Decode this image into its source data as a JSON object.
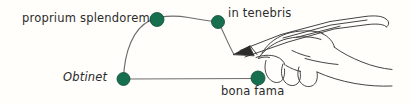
{
  "canvas": {
    "width": 412,
    "height": 104,
    "background": "#fffefb"
  },
  "palette": {
    "node_fill": "#16704f",
    "node_stroke": "#0d4a34",
    "edge_stroke": "#6d6d6d",
    "ink_stroke": "#3a3a3a",
    "text_color": "#2b2b2b"
  },
  "diagram": {
    "title": "",
    "nodes": [
      {
        "id": "obtinet",
        "label": "Obtinet",
        "x": 123,
        "y": 79,
        "r": 6.5,
        "label_position": "left"
      },
      {
        "id": "proprium-splendorem",
        "label": "proprium splendorem",
        "x": 157,
        "y": 19,
        "r": 7,
        "label_position": "left"
      },
      {
        "id": "in-tenebris",
        "label": "in tenebris",
        "x": 218,
        "y": 22,
        "r": 6.5,
        "label_position": "right"
      },
      {
        "id": "bona-fama",
        "label": "bona fama",
        "x": 258,
        "y": 78,
        "r": 7,
        "label_position": "below"
      }
    ],
    "edges": [
      {
        "id": "arc-edge",
        "from": "obtinet",
        "to": "pen-tip",
        "style": "curved-arc"
      },
      {
        "id": "base-edge",
        "from": "obtinet",
        "to": "bona-fama",
        "style": "straight"
      }
    ],
    "annotation": {
      "drawing": "hand-holding-pen",
      "pen_tip": {
        "x": 234,
        "y": 54
      }
    }
  }
}
